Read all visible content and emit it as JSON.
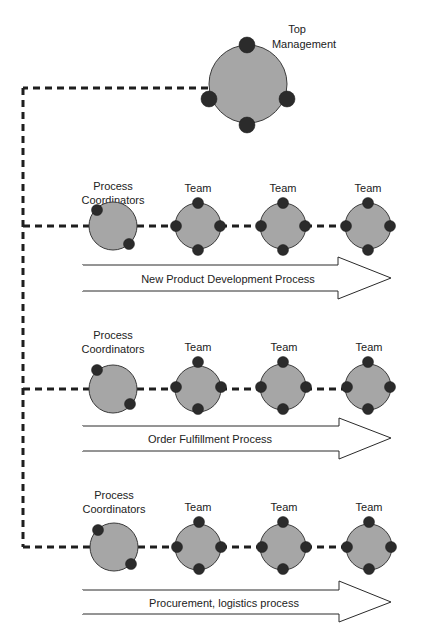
{
  "diagram": {
    "colors": {
      "node_fill": "#a6a6a6",
      "dot_fill": "#2b2b2b",
      "line": "#1e1e1e",
      "arrow_fill": "#ffffff"
    },
    "top": {
      "label_line1": "Top",
      "label_line2": "Management"
    },
    "rows": [
      {
        "coordinator_label_line1": "Process",
        "coordinator_label_line2": "Coordinators",
        "teams": [
          {
            "label": "Team"
          },
          {
            "label": "Team"
          },
          {
            "label": "Team"
          }
        ],
        "process_label": "New Product Development Process"
      },
      {
        "coordinator_label_line1": "Process",
        "coordinator_label_line2": "Coordinators",
        "teams": [
          {
            "label": "Team"
          },
          {
            "label": "Team"
          },
          {
            "label": "Team"
          }
        ],
        "process_label": "Order Fulfillment Process"
      },
      {
        "coordinator_label_line1": "Process",
        "coordinator_label_line2": "Coordinators",
        "teams": [
          {
            "label": "Team"
          },
          {
            "label": "Team"
          },
          {
            "label": "Team"
          }
        ],
        "process_label": "Procurement, logistics process"
      }
    ]
  }
}
